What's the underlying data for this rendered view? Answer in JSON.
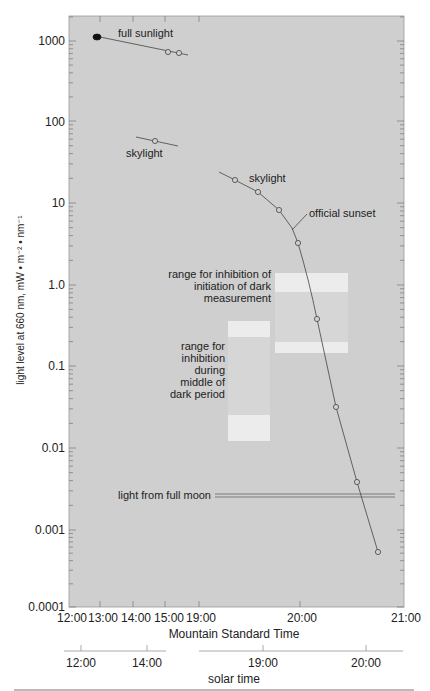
{
  "chart_data": {
    "type": "line",
    "title": "",
    "ylabel": "light level at 660 nm, mW • m⁻² • nm⁻¹",
    "xlabel": "Mountain Standard Time",
    "xlabel2": "solar time",
    "yscale": "log",
    "ylim": [
      0.0001,
      2000
    ],
    "y_ticks": [
      "1000",
      "100",
      "10",
      "1.0",
      "0.1",
      "0.01",
      "0.001",
      "0.0001"
    ],
    "x_ticks_mst": [
      "12:00",
      "13:00",
      "14:00",
      "15:00",
      "19:00",
      "20:00",
      "21:00"
    ],
    "x_ticks_solar": [
      "12:00",
      "14:00",
      "19:00",
      "20:00"
    ],
    "grid": false,
    "background": "#cfcfcf",
    "series": [
      {
        "name": "full sunlight",
        "points": [
          {
            "x": "12:55",
            "y": 1150,
            "marker": "filled"
          },
          {
            "x": "15:05",
            "y": 720,
            "marker": "open"
          },
          {
            "x": "15:25",
            "y": 700,
            "marker": "open"
          }
        ]
      },
      {
        "name": "skylight (afternoon)",
        "points": [
          {
            "x": "14:40",
            "y": 58,
            "marker": "open"
          }
        ]
      },
      {
        "name": "skylight (evening)",
        "points": [
          {
            "x": "19:21",
            "y": 19
          },
          {
            "x": "19:35",
            "y": 13
          },
          {
            "x": "19:48",
            "y": 8
          },
          {
            "x": "19:59",
            "y": 3.2
          },
          {
            "x": "20:11",
            "y": 0.37
          },
          {
            "x": "20:22",
            "y": 0.03
          },
          {
            "x": "20:35",
            "y": 0.0035
          },
          {
            "x": "20:47",
            "y": 0.00045
          }
        ]
      }
    ],
    "annotations": [
      {
        "text": "full sunlight"
      },
      {
        "text": "skylight"
      },
      {
        "text": "skylight"
      },
      {
        "text": "official sunset",
        "x": "19:55"
      },
      {
        "text": "light from full moon",
        "y": 0.0023
      }
    ],
    "bands": [
      {
        "label": "range for inhibition of initiation of dark measurement",
        "x_range": [
          "19:45",
          "20:45"
        ],
        "outer_y": [
          1.4,
          0.14
        ],
        "inner_y": [
          0.8,
          0.18
        ]
      },
      {
        "label": "range for inhibition during middle of dark period",
        "x_range": [
          "19:17",
          "19:45"
        ],
        "outer_y": [
          0.35,
          0.011
        ],
        "inner_y": [
          0.22,
          0.022
        ]
      }
    ]
  },
  "labels": {
    "full_sunlight": "full sunlight",
    "skylight1": "skylight",
    "skylight2": "skylight",
    "official_sunset": "official sunset",
    "moon": "light from full moon",
    "band1": [
      "range for inhibition of",
      "initiation of dark",
      "measurement"
    ],
    "band2": [
      "range for",
      "inhibition",
      "during",
      "middle of",
      "dark period"
    ],
    "caption": "Fig. 5  Light levels measured on the 1000 m above sea and light ... "
  }
}
